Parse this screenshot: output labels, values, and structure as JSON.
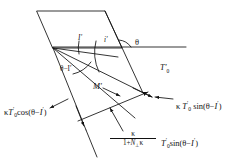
{
  "figure": {
    "type": "vector-line-diagram",
    "title": "",
    "background_color": "#ffffff",
    "stroke_color": "#111111",
    "width": 239,
    "height": 163
  },
  "labels": {
    "angle_I_prime": "I′",
    "angle_i_prime": "i′",
    "angle_theta": "θ",
    "angle_theta_minus_I_prime": "θ−I′",
    "vector_M_prime": "M′",
    "vector_T0_prime": "T′",
    "vector_T0_prime_sub": "0",
    "left_expression": "κT′0cos (θ−I′)",
    "right_expression": "κ T′0 sin (θ−I′)",
    "fraction_numerator": "κ",
    "fraction_denominator": "1+N⊥κ",
    "fraction_trailing": "T′0sin (θ−I′)"
  },
  "parts": {
    "kappa": "κ",
    "T": "T",
    "prime": "′",
    "zero": "0",
    "cos": "cos",
    "sin": "sin",
    "theta": "θ",
    "minus": "−",
    "I": "I",
    "open_paren": "(",
    "close_paren": ")",
    "one_plus": "1+",
    "N": "N",
    "perp": "⊥"
  },
  "geometry": {
    "parallelogram": [
      [
        37,
        11
      ],
      [
        105,
        11
      ],
      [
        122,
        48
      ],
      [
        53,
        48
      ]
    ],
    "horizon_line": [
      [
        53,
        47
      ],
      [
        186,
        47
      ]
    ],
    "apex": [
      53,
      48
    ]
  }
}
